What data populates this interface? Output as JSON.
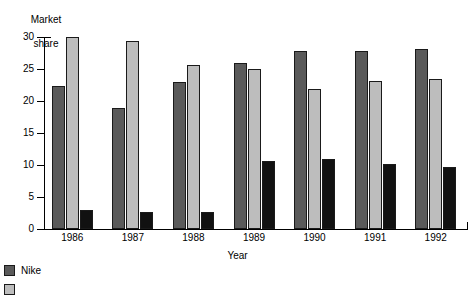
{
  "chart_data": {
    "type": "bar",
    "title": "",
    "xlabel": "Year",
    "ylabel": "Market share",
    "ylabel_lines": [
      "Market",
      "share"
    ],
    "categories": [
      "1986",
      "1987",
      "1988",
      "1989",
      "1990",
      "1991",
      "1992"
    ],
    "ylim": [
      0,
      30
    ],
    "yticks": [
      0,
      5,
      10,
      15,
      20,
      25,
      30
    ],
    "ytick_labels": [
      "0",
      "5",
      "10",
      "15",
      "20",
      "25",
      "30"
    ],
    "grid": false,
    "legend_position": "below-left",
    "series": [
      {
        "name": "Nike",
        "color": "#5a5a5a",
        "values": [
          22.4,
          18.9,
          22.9,
          26.0,
          27.8,
          27.8,
          28.1
        ]
      },
      {
        "name": "",
        "color": "#bdbdbd",
        "values": [
          30.0,
          29.4,
          25.6,
          25.0,
          21.9,
          23.1,
          23.5
        ]
      },
      {
        "name": "",
        "color": "#111111",
        "values": [
          3.0,
          2.7,
          2.7,
          10.7,
          11.0,
          10.2,
          9.7
        ]
      }
    ]
  },
  "legend": {
    "items": [
      {
        "label": "Nike",
        "color": "#5a5a5a"
      },
      {
        "label": "",
        "color": "#bdbdbd"
      }
    ]
  }
}
